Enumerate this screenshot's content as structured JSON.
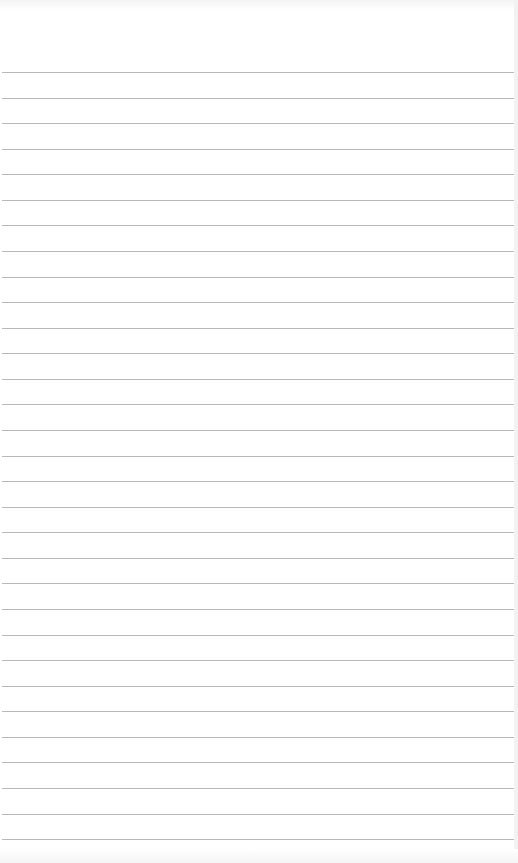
{
  "document": {
    "type": "ruled-paper",
    "background_color": "#ffffff",
    "rule_color": "#b8b8b8",
    "rule_count": 31,
    "first_rule_y": 72,
    "rule_spacing": 25.57,
    "lines": [
      "",
      "",
      "",
      "",
      "",
      "",
      "",
      "",
      "",
      "",
      "",
      "",
      "",
      "",
      "",
      "",
      "",
      "",
      "",
      "",
      "",
      "",
      "",
      "",
      "",
      "",
      "",
      "",
      "",
      "",
      ""
    ]
  }
}
